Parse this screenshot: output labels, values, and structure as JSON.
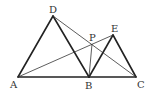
{
  "diagram": {
    "type": "geometry",
    "points": {
      "A": {
        "label": "A",
        "x": 18,
        "y": 77
      },
      "B": {
        "label": "B",
        "x": 89,
        "y": 77
      },
      "C": {
        "label": "C",
        "x": 136,
        "y": 77
      },
      "D": {
        "label": "D",
        "x": 53,
        "y": 16
      },
      "E": {
        "label": "E",
        "x": 113,
        "y": 35
      },
      "P": {
        "label": "P",
        "x": 92,
        "y": 44
      }
    },
    "thick_segments": [
      "AB",
      "BC",
      "AD",
      "DB",
      "BE",
      "EC"
    ],
    "thin_segments": [
      "AE",
      "DC",
      "PB"
    ],
    "line_color": "#222222"
  }
}
